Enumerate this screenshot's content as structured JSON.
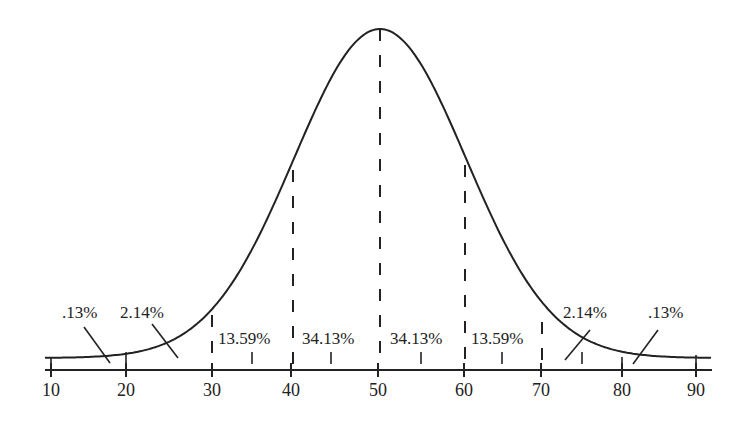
{
  "chart_data": {
    "type": "area",
    "title": "",
    "mean": 50,
    "sd": 10,
    "xlabel": "",
    "ylabel": "",
    "xlim": [
      10,
      92
    ],
    "x_ticks": [
      10,
      20,
      30,
      40,
      50,
      60,
      70,
      80,
      90
    ],
    "x_tick_labels": [
      "10",
      "20",
      "30",
      "40",
      "50",
      "60",
      "70",
      "80",
      "90"
    ],
    "minor_ticks": [
      35,
      45,
      55,
      65,
      75
    ],
    "dashed_lines": [
      30,
      40,
      50,
      60,
      70
    ],
    "bands": [
      {
        "range": "<20",
        "label": ".13%",
        "value": 0.13
      },
      {
        "range": "20-30",
        "label": "2.14%",
        "value": 2.14
      },
      {
        "range": "30-40",
        "label": "13.59%",
        "value": 13.59
      },
      {
        "range": "40-50",
        "label": "34.13%",
        "value": 34.13
      },
      {
        "range": "50-60",
        "label": "34.13%",
        "value": 34.13
      },
      {
        "range": "60-70",
        "label": "13.59%",
        "value": 13.59
      },
      {
        "range": "70-80",
        "label": "2.14%",
        "value": 2.14
      },
      {
        "range": ">80",
        "label": ".13%",
        "value": 0.13
      }
    ],
    "grid": false,
    "legend": null
  },
  "labels": {
    "left_tail": ".13%",
    "left_2sd": "2.14%",
    "left_1sd_band": "13.59%",
    "left_center": "34.13%",
    "right_center": "34.13%",
    "right_1sd_band": "13.59%",
    "right_2sd": "2.14%",
    "right_tail": ".13%"
  },
  "ticks": {
    "t10": "10",
    "t20": "20",
    "t30": "30",
    "t40": "40",
    "t50": "50",
    "t60": "60",
    "t70": "70",
    "t80": "80",
    "t90": "90"
  }
}
